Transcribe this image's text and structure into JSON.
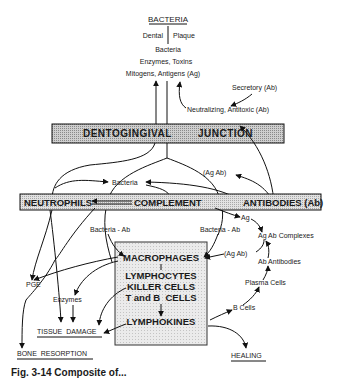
{
  "diagram": {
    "top": {
      "title": "BACTERIA",
      "dental": "Dental",
      "plaque": "Plaque",
      "bacteria": "Bacteria",
      "enzymes_toxins": "Enzymes,  Toxins",
      "mitogens_antigens": "Mitogens,   Antigens (Ag)",
      "secretory": "Secretory (Ab)",
      "neutralizing": "Neutralizing,  Antitoxic (Ab)"
    },
    "bands": {
      "junction": "DENTOGINGIVAL        JUNCTION",
      "neutrophils": "NEUTROPHILS",
      "complement": "COMPLEMENT",
      "antibodies": "ANTIBODIES (Ab)"
    },
    "middle": {
      "ag_ab_top": "(Ag Ab)",
      "bacteria": "Bacteria",
      "ag": "Ag",
      "bacteria_ab_left": "Bacteria - Ab",
      "bacteria_ab_right": "Bacteria - Ab",
      "ag_ab_complexes": "Ag Ab Complexes",
      "ag_ab_mid": "(Ag Ab)",
      "ab_antibodies": "Ab Antibodies",
      "plasma_cells": "Plasma Cells",
      "b_cells": "B Cells"
    },
    "box": {
      "macrophages": "MACROPHAGES",
      "lymphocytes": "LYMPHOCYTES",
      "killer_cells": "KILLER CELLS",
      "t_b_cells": "T and B  CELLS",
      "lymphokines": "LYMPHOKINES"
    },
    "outcomes": {
      "pge": "PGE",
      "enzymes": "Enzymes",
      "tissue_damage": "TISSUE  DAMAGE",
      "bone_resorption": "BONE  RESORPTION",
      "healing": "HEALING"
    },
    "caption": "Fig. 3-14 Composite of..."
  }
}
